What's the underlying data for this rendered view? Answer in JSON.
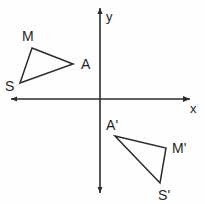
{
  "figure": {
    "background_color": "#fefefe",
    "ink_color": "#2b2b2b",
    "width": 205,
    "height": 204
  },
  "axes": {
    "origin": {
      "x": 100,
      "y": 99
    },
    "x_axis": {
      "label": "x",
      "label_pos": {
        "x": 190,
        "y": 102
      },
      "start": {
        "x": 11,
        "y": 99
      },
      "end": {
        "x": 190,
        "y": 99
      },
      "has_arrows": true
    },
    "y_axis": {
      "label": "y",
      "label_pos": {
        "x": 106,
        "y": 10
      },
      "start": {
        "x": 100,
        "y": 8
      },
      "end": {
        "x": 100,
        "y": 193
      },
      "has_arrows": true
    }
  },
  "shapes": [
    {
      "name": "triangle-SMA",
      "quadrant": "II",
      "vertices": [
        {
          "label": "M",
          "x": 32,
          "y": 48,
          "label_pos": {
            "x": 22,
            "y": 29
          }
        },
        {
          "label": "A",
          "x": 73,
          "y": 64,
          "label_pos": {
            "x": 81,
            "y": 57
          }
        },
        {
          "label": "S",
          "x": 20,
          "y": 83,
          "label_pos": {
            "x": 5,
            "y": 79
          }
        }
      ],
      "path": "M 32 48 L 73 64 L 20 83 Z"
    },
    {
      "name": "triangle-A-prime-M-prime-S-prime",
      "quadrant": "IV",
      "vertices": [
        {
          "label": "A'",
          "x": 115,
          "y": 136,
          "label_pos": {
            "x": 106,
            "y": 118
          }
        },
        {
          "label": "M'",
          "x": 166,
          "y": 148,
          "label_pos": {
            "x": 172,
            "y": 141
          }
        },
        {
          "label": "S'",
          "x": 160,
          "y": 183,
          "label_pos": {
            "x": 158,
            "y": 188
          }
        }
      ],
      "path": "M 115 136 L 166 148 L 160 183 Z"
    }
  ]
}
